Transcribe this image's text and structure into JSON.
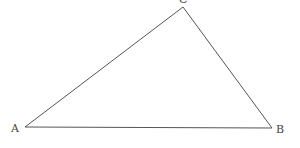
{
  "diagram": {
    "type": "triangle",
    "stroke_color": "#555555",
    "vertices": [
      {
        "label": "A",
        "x": 25,
        "y": 127,
        "label_x": 11,
        "label_y": 132
      },
      {
        "label": "B",
        "x": 272,
        "y": 128,
        "label_x": 276,
        "label_y": 133
      },
      {
        "label": "C",
        "x": 183,
        "y": 7,
        "label_x": 179,
        "label_y": 3
      }
    ],
    "edges": [
      {
        "from": "A",
        "to": "B"
      },
      {
        "from": "B",
        "to": "C"
      },
      {
        "from": "C",
        "to": "A"
      }
    ]
  }
}
